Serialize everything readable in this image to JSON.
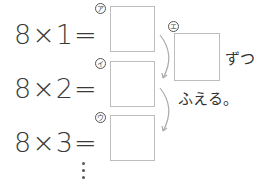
{
  "equations": [
    {
      "text": "8×1=",
      "label": "ア"
    },
    {
      "text": "8×2=",
      "label": "イ"
    },
    {
      "text": "8×3=",
      "label": "ウ"
    }
  ],
  "increase_box": {
    "label": "エ"
  },
  "suffix_text": "ずつ",
  "increase_text": "ふえる。",
  "continuation": "⋮",
  "colors": {
    "box_border": "#bdbdbd",
    "arrow": "#aaaaaa",
    "text": "#333333"
  }
}
